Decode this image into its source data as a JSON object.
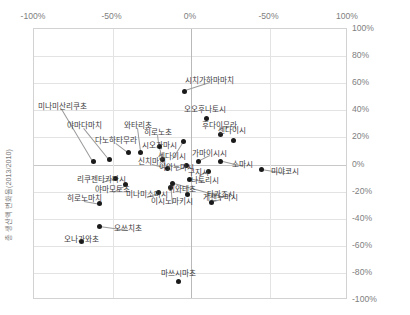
{
  "chart_data": {
    "type": "scatter",
    "title": "",
    "xlabel": "",
    "ylabel": "총 생산액 변화율(2013/2010)",
    "xlim": [
      -100,
      100
    ],
    "ylim": [
      -100,
      100
    ],
    "grid": true,
    "legend": "none",
    "x_tick_labels": [
      "-100%",
      "-50%",
      "0%",
      "-50%",
      "100%"
    ],
    "x_tick_values": [
      -100,
      -50,
      0,
      50,
      100
    ],
    "y_tick_labels": [
      "100%",
      "80%",
      "60%",
      "40%",
      "20%",
      "0%",
      "-20%",
      "-40%",
      "-60%",
      "-80%",
      "-100%"
    ],
    "y_tick_values": [
      100,
      80,
      60,
      40,
      20,
      0,
      -20,
      -40,
      -60,
      -80,
      -100
    ],
    "points": [
      {
        "label": "미나미산리쿠초",
        "x": -62,
        "y": 2,
        "label_x": -82,
        "label_y": 44,
        "anchor": "mid"
      },
      {
        "label": "야마다마치",
        "x": -52,
        "y": 4,
        "label_x": -68,
        "label_y": 30,
        "anchor": "mid"
      },
      {
        "label": "다노하타무라",
        "x": -40,
        "y": 9,
        "label_x": -48,
        "label_y": 19,
        "anchor": "mid"
      },
      {
        "label": "와타리초",
        "x": -32,
        "y": 9,
        "label_x": -34,
        "label_y": 30,
        "anchor": "mid"
      },
      {
        "label": "히로노초",
        "x": -20,
        "y": 13,
        "label_x": -21,
        "label_y": 25,
        "anchor": "mid"
      },
      {
        "label": "시오가마시",
        "x": -18,
        "y": 4,
        "label_x": -20,
        "label_y": 15,
        "anchor": "mid"
      },
      {
        "label": "신치마치",
        "x": -15,
        "y": -3,
        "label_x": -25,
        "label_y": 3,
        "anchor": "mid"
      },
      {
        "label": "센다이시",
        "x": -5,
        "y": 17,
        "label_x": -12,
        "label_y": 7,
        "anchor": "mid"
      },
      {
        "label": "시치가하마마치",
        "x": -4,
        "y": 54,
        "label_x": 12,
        "label_y": 63,
        "anchor": "mid"
      },
      {
        "label": "오오후나토시",
        "x": 10,
        "y": 34,
        "label_x": 9,
        "label_y": 42,
        "anchor": "mid"
      },
      {
        "label": "후다이무라",
        "x": 19,
        "y": 22,
        "label_x": 18,
        "label_y": 30,
        "anchor": "mid"
      },
      {
        "label": "센다이시",
        "x": 27,
        "y": 18,
        "label_x": 26,
        "label_y": 26,
        "anchor": "mid"
      },
      {
        "label": "가마이시시",
        "x": 5,
        "y": 2,
        "label_x": 12,
        "label_y": 9,
        "anchor": "mid"
      },
      {
        "label": "이와누마시",
        "x": -3,
        "y": -1,
        "label_x": -9,
        "label_y": -1,
        "anchor": "mid"
      },
      {
        "label": "소마시",
        "x": 19,
        "y": 2,
        "label_x": 33,
        "label_y": 1,
        "anchor": "mid"
      },
      {
        "label": "구지시",
        "x": 11,
        "y": -5,
        "label_x": 5,
        "label_y": -5,
        "anchor": "mid"
      },
      {
        "label": "미야코시",
        "x": 45,
        "y": -4,
        "label_x": 60,
        "label_y": -4,
        "anchor": "mid"
      },
      {
        "label": "나토리시",
        "x": -1,
        "y": -11,
        "label_x": 9,
        "label_y": -11,
        "anchor": "mid"
      },
      {
        "label": "타가죠시",
        "x": -12,
        "y": -14,
        "label_x": 19,
        "label_y": -21,
        "anchor": "mid"
      },
      {
        "label": "이시노마키시",
        "x": -13,
        "y": -17,
        "label_x": -12,
        "label_y": -26,
        "anchor": "mid"
      },
      {
        "label": "리쿠젠타카타시",
        "x": -48,
        "y": -10,
        "label_x": -57,
        "label_y": -10,
        "anchor": "mid"
      },
      {
        "label": "야마모토초",
        "x": -42,
        "y": -15,
        "label_x": -50,
        "label_y": -17,
        "anchor": "mid"
      },
      {
        "label": "미나미소마시",
        "x": -21,
        "y": -21,
        "label_x": -28,
        "label_y": -21,
        "anchor": "mid"
      },
      {
        "label": "이와테초",
        "x": -2,
        "y": -22,
        "label_x": -6,
        "label_y": -17,
        "anchor": "mid"
      },
      {
        "label": "게센누마시",
        "x": 13,
        "y": -28,
        "label_x": 19,
        "label_y": -23,
        "anchor": "mid"
      },
      {
        "label": "히로노마치",
        "x": -58,
        "y": -29,
        "label_x": -68,
        "label_y": -24,
        "anchor": "mid"
      },
      {
        "label": "오쓰치초",
        "x": -58,
        "y": -46,
        "label_x": -40,
        "label_y": -46,
        "anchor": "mid"
      },
      {
        "label": "오나가와초",
        "x": -70,
        "y": -57,
        "label_x": -70,
        "label_y": -54,
        "anchor": "mid"
      },
      {
        "label": "마쓰시마초",
        "x": -8,
        "y": -86,
        "label_x": -8,
        "label_y": -79,
        "anchor": "mid"
      }
    ]
  }
}
